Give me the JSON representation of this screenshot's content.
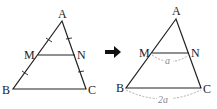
{
  "diagram": {
    "left_triangle": {
      "vertices": {
        "A": "A",
        "B": "B",
        "C": "C"
      },
      "midpoints": {
        "M": "M",
        "N": "N"
      },
      "tick_marks": "AM = MB, AN = NC"
    },
    "arrow": "right-arrow",
    "right_triangle": {
      "vertices": {
        "A": "A",
        "B": "B",
        "C": "C"
      },
      "midpoints": {
        "M": "M",
        "N": "N"
      },
      "mn_length_label": "a",
      "bc_length_label": "2a"
    },
    "colors": {
      "line": "#222222",
      "dashed": "#999999",
      "background": "#ffffff"
    }
  }
}
